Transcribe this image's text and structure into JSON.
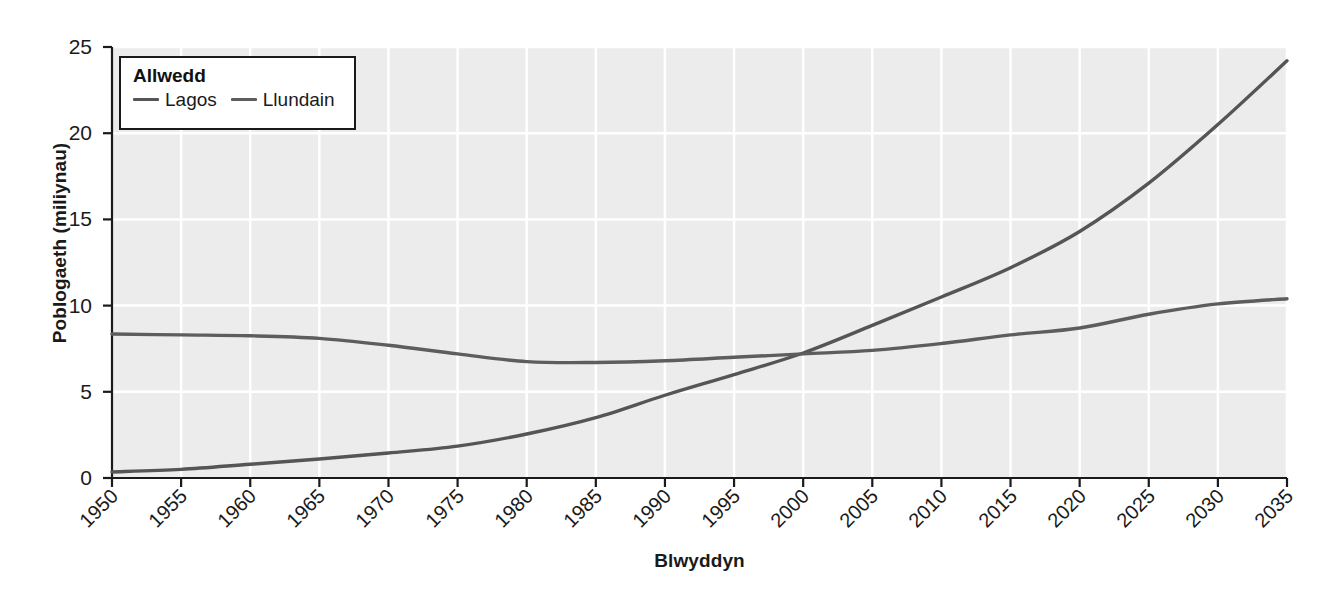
{
  "chart_data": {
    "type": "line",
    "title": "",
    "xlabel": "Blwyddyn",
    "ylabel": "Poblogaeth (miliynau)",
    "xlim": [
      1950,
      2035
    ],
    "ylim": [
      0,
      25
    ],
    "xticks": [
      "1950",
      "1955",
      "1960",
      "1965",
      "1970",
      "1975",
      "1980",
      "1985",
      "1990",
      "1995",
      "2000",
      "2005",
      "2010",
      "2015",
      "2020",
      "2025",
      "2030",
      "2035"
    ],
    "yticks": [
      "0",
      "5",
      "10",
      "15",
      "20",
      "25"
    ],
    "grid": true,
    "legend": {
      "title": "Allwedd",
      "position": "upper-left-inside"
    },
    "x": [
      1950,
      1955,
      1960,
      1965,
      1970,
      1975,
      1980,
      1985,
      1990,
      1995,
      2000,
      2005,
      2010,
      2015,
      2020,
      2025,
      2030,
      2035
    ],
    "series": [
      {
        "name": "Lagos",
        "color": "#555555",
        "values": [
          0.35,
          0.5,
          0.8,
          1.1,
          1.45,
          1.85,
          2.55,
          3.5,
          4.8,
          6.0,
          7.25,
          8.85,
          10.5,
          12.2,
          14.3,
          17.1,
          20.5,
          24.2
        ]
      },
      {
        "name": "Llundain",
        "color": "#5d5d5d",
        "values": [
          8.35,
          8.3,
          8.25,
          8.1,
          7.7,
          7.2,
          6.75,
          6.7,
          6.8,
          7.0,
          7.2,
          7.4,
          7.8,
          8.3,
          8.7,
          9.5,
          10.1,
          10.4
        ]
      }
    ],
    "colors": {
      "plot_background": "#ececec",
      "gridline": "#ffffff",
      "axis": "#1a1a1a",
      "page_background": "#ffffff"
    }
  }
}
